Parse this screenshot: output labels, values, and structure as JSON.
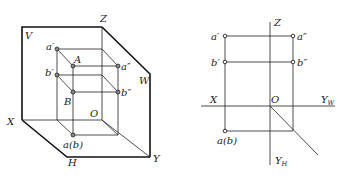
{
  "diagram": {
    "left": {
      "title": "Three-plane projection system (3D)",
      "labels": {
        "Z": "Z",
        "V": "V",
        "W": "W",
        "X": "X",
        "H": "H",
        "Y": "Y",
        "O": "O",
        "a_prime": "a′",
        "A": "A",
        "a_dprime": "a″",
        "b_prime": "b′",
        "B": "B",
        "b_dprime": "b″",
        "ab": "a(b)"
      }
    },
    "right": {
      "title": "Orthographic projection (unfolded)",
      "labels": {
        "Z": "Z",
        "X": "X",
        "O": "O",
        "Y_W": "Y",
        "Y_W_sub": "W",
        "Y_H": "Y",
        "Y_H_sub": "H",
        "a_prime": "a′",
        "a_dprime": "a″",
        "b_prime": "b′",
        "b_dprime": "b″",
        "ab": "a(b)"
      }
    }
  }
}
